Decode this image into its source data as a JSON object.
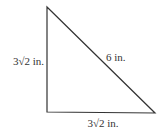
{
  "diagram": {
    "type": "right-triangle",
    "vertices": {
      "top": [
        47,
        7
      ],
      "right_angle": [
        47,
        112
      ],
      "bottom_right": [
        155,
        113
      ]
    },
    "labels": {
      "left_leg": "3√2 in.",
      "hypotenuse": "6 in.",
      "bottom_leg": "3√2 in."
    },
    "stroke_color": "#333333"
  }
}
